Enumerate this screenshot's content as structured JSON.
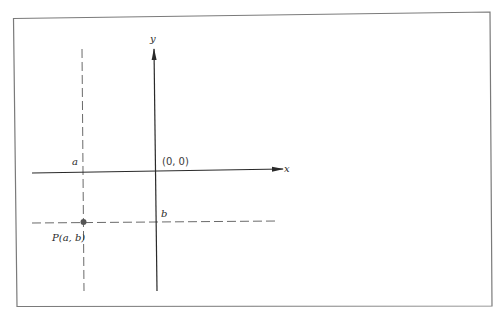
{
  "diagram": {
    "type": "coordinate-plane",
    "colors": {
      "frame": "#7a7a7a",
      "axis": "#2a2a2a",
      "dashed": "#6a6a6a",
      "point": "#555555",
      "background": "#ffffff"
    },
    "axes": {
      "x_label": "x",
      "y_label": "y"
    },
    "origin_label": "(0, 0)",
    "tick_labels": {
      "a": "a",
      "b": "b"
    },
    "point": {
      "label": "P(a, b)",
      "x": "a",
      "y": "b"
    },
    "guide_lines": [
      {
        "orientation": "vertical",
        "through": "a",
        "style": "dashed"
      },
      {
        "orientation": "horizontal",
        "through": "b",
        "style": "dashed"
      }
    ]
  }
}
